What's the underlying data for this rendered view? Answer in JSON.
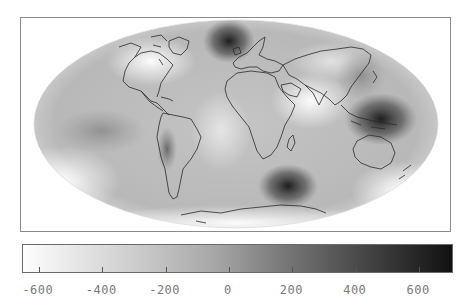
{
  "map": {
    "projection": "Mollweide",
    "colormap": "grayscale (white = low, black = high)",
    "features": [
      {
        "name": "north-atlantic-high",
        "shade": "dark",
        "x": 230,
        "y": 42
      },
      {
        "name": "indonesia-new-guinea-high",
        "shade": "darkest",
        "x": 380,
        "y": 118
      },
      {
        "name": "south-of-africa-high",
        "shade": "dark",
        "x": 285,
        "y": 185
      },
      {
        "name": "andes-high",
        "shade": "dark",
        "x": 165,
        "y": 150
      },
      {
        "name": "indian-ocean-low",
        "shade": "light",
        "x": 310,
        "y": 105
      },
      {
        "name": "hudson-bay-low",
        "shade": "light",
        "x": 150,
        "y": 55
      }
    ]
  },
  "colorbar": {
    "min": -650,
    "max": 710,
    "start_color": "#ffffff",
    "end_color": "#111111",
    "ticks": [
      {
        "value": -600,
        "label": "-600"
      },
      {
        "value": -400,
        "label": "-400"
      },
      {
        "value": -200,
        "label": "-200"
      },
      {
        "value": 0,
        "label": "0"
      },
      {
        "value": 200,
        "label": "200"
      },
      {
        "value": 400,
        "label": "400"
      },
      {
        "value": 600,
        "label": "600"
      }
    ]
  }
}
